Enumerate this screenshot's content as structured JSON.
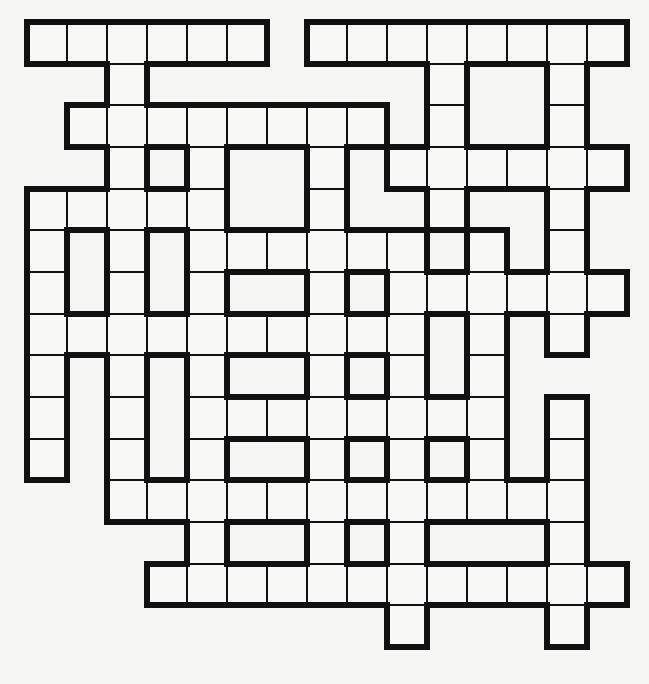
{
  "puzzle": {
    "type": "crossword-grid",
    "rows_count": 15,
    "cols_count": 15,
    "cell_width": 40,
    "cell_height": 41.67,
    "line_color": "#111111",
    "cell_color": "#f8f8f7",
    "background_color": "#f6f6f5",
    "thin_line_width": 2,
    "thick_line_width": 6,
    "legend": {
      "#": "white-cell",
      ".": "no-cell"
    },
    "rows": [
      "######.########",
      "..#.......#..#.",
      ".########.#..#.",
      "..#.#..#.######",
      "#####..#..#..#.",
      "#.#.######.#.#.",
      "#.#.#..#.######",
      "##########.#.#.",
      "#.#.#..#.#.#...",
      "#.#.########.#.",
      "#.#.#..#.#.#.#.",
      "..############.",
      "....#..#.#...#.",
      "...############",
      ".........#...#."
    ]
  }
}
